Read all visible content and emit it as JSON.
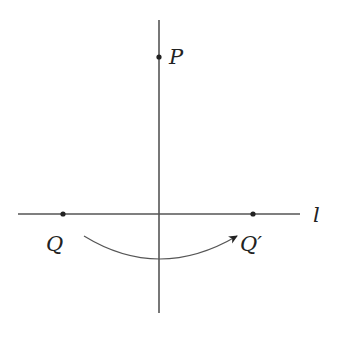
{
  "diagram": {
    "colors": {
      "line": "#555555",
      "point": "#222222",
      "text": "#222222"
    },
    "axes": {
      "vertical": {
        "x": 159,
        "y1": 20,
        "y2": 313
      },
      "horizontal": {
        "y": 214,
        "x1": 18,
        "x2": 300,
        "label": "l"
      }
    },
    "points": [
      {
        "id": "P",
        "label": "P",
        "x": 159,
        "y": 57
      },
      {
        "id": "Q",
        "label": "Q",
        "x": 63,
        "y": 214
      },
      {
        "id": "Q_prime",
        "label": "Q′",
        "x": 253,
        "y": 214
      }
    ],
    "arc": {
      "from": "Q",
      "to": "Q_prime",
      "description": "curved arrow below the line from Q to Q′"
    }
  }
}
